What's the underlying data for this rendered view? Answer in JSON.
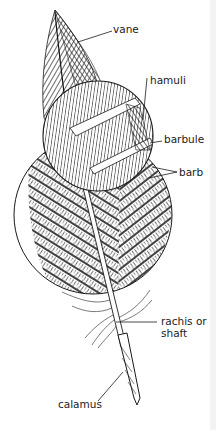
{
  "diagram": {
    "labels": {
      "vane": "vane",
      "hamuli": "hamuli",
      "barbule": "barbule",
      "barb": "barb",
      "rachis_line1": "rachis or",
      "rachis_line2": "shaft",
      "calamus": "calamus"
    },
    "colors": {
      "ink": "#1a1a1a",
      "background": "#ffffff"
    }
  }
}
